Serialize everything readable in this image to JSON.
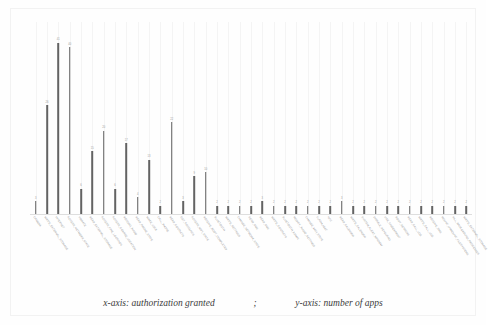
{
  "caption": {
    "x_part": "x-axis: authorization granted",
    "separator": ";",
    "y_part": "y-axis: number of apps"
  },
  "chart_data": {
    "type": "bar",
    "title": "",
    "xlabel": "authorization granted",
    "ylabel": "number of apps",
    "grid": true,
    "legend": "none",
    "ylim": [
      0,
      46
    ],
    "categories": [
      "CAMERA",
      "WRITE_EXTERNAL_STORAGE",
      "INTERNET",
      "ACCESS_NETWORK_STATE",
      "VIBRATE",
      "READ_EXTERNAL_STORAGE",
      "ACCESS_FINE_LOCATION",
      "ACCESS_COARSE_LOCATION",
      "RECORD_AUDIO",
      "READ_PHONE_STATE",
      "WAKE_LOCK",
      "CALL_PHONE",
      "READ_CONTACTS",
      "GET_ACCOUNTS",
      "ACCESS_WIFI_STATE",
      "RECEIVE_BOOT_COMPLETED",
      "BLUETOOTH",
      "WRITE_SETTINGS",
      "CHANGE_NETWORK_STATE",
      "SEND_SMS",
      "READ_SMS",
      "WRITE_CONTACTS",
      "BLUETOOTH_ADMIN",
      "MODIFY_AUDIO_SETTINGS",
      "CHANGE_WIFI_STATE",
      "FLASHLIGHT",
      "NFC",
      "READ_CALENDAR",
      "WRITE_CALENDAR",
      "SYSTEM_ALERT_WINDOW",
      "DISABLE_KEYGUARD",
      "USE_FINGERPRINT",
      "BODY_SENSORS",
      "READ_CALL_LOG",
      "WRITE_CALL_LOG",
      "RECEIVE_SMS",
      "MOUNT_UNMOUNT_FILESYSTEMS",
      "KILL_BACKGROUND_PROCESSES",
      "WRITE_EXTERNAL_STORAGE_2"
    ],
    "values": [
      3,
      26,
      41,
      40,
      6,
      15,
      20,
      6,
      17,
      4,
      13,
      2,
      22,
      3,
      9,
      10,
      2,
      2,
      2,
      2,
      3,
      2,
      2,
      2,
      2,
      2,
      2,
      3,
      2,
      2,
      2,
      2,
      2,
      2,
      2,
      2,
      2,
      2,
      2
    ],
    "value_labels": [
      "3",
      "26",
      "41",
      "40",
      "6",
      "15",
      "20",
      "6",
      "17",
      "4",
      "13",
      "2",
      "22",
      "3",
      "9",
      "10",
      "2",
      "2",
      "2",
      "2",
      "3",
      "2",
      "2",
      "2",
      "2",
      "2",
      "2",
      "3",
      "2",
      "2",
      "2",
      "2",
      "2",
      "2",
      "2",
      "2",
      "2",
      "2",
      "2"
    ],
    "bar_color": "#636363",
    "grid_color": "#f4f4f4"
  }
}
